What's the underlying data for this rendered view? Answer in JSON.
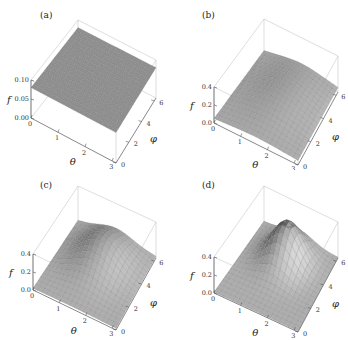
{
  "chart_data": [
    {
      "type": "surface3d",
      "panel": "(a)",
      "xlabel": "θ",
      "ylabel": "φ",
      "zlabel": "f",
      "x_ticks": [
        "0",
        "1",
        "2",
        "3"
      ],
      "y_ticks": [
        "0",
        "2",
        "4",
        "6"
      ],
      "z_ticks": [
        "0.00",
        "0.05",
        "0.10"
      ],
      "xlim": [
        0,
        3.14
      ],
      "ylim": [
        0,
        6.28
      ],
      "zlim": [
        0,
        0.1
      ],
      "surface": {
        "kind": "flat",
        "value": 0.08
      },
      "grid": true
    },
    {
      "type": "surface3d",
      "panel": "(b)",
      "xlabel": "θ",
      "ylabel": "φ",
      "zlabel": "f",
      "x_ticks": [
        "0",
        "1",
        "2",
        "3"
      ],
      "y_ticks": [
        "0",
        "2",
        "4",
        "6"
      ],
      "z_ticks": [
        "0.0",
        "0.2",
        "0.4"
      ],
      "xlim": [
        0,
        3.14
      ],
      "ylim": [
        0,
        6.28
      ],
      "zlim": [
        0,
        0.4
      ],
      "surface": {
        "kind": "peak",
        "base": 0.05,
        "amplitude": 0.12,
        "theta0": 1.6,
        "phi0": 3.8,
        "sigma_theta": 1.1,
        "sigma_phi": 2.2
      },
      "grid": true
    },
    {
      "type": "surface3d",
      "panel": "(c)",
      "xlabel": "θ",
      "ylabel": "φ",
      "zlabel": "f",
      "x_ticks": [
        "0",
        "1",
        "2",
        "3"
      ],
      "y_ticks": [
        "0",
        "2",
        "4",
        "6"
      ],
      "z_ticks": [
        "0.0",
        "0.2",
        "0.4"
      ],
      "xlim": [
        0,
        3.14
      ],
      "ylim": [
        0,
        6.28
      ],
      "zlim": [
        0,
        0.4
      ],
      "surface": {
        "kind": "peak",
        "base": 0.02,
        "amplitude": 0.28,
        "theta0": 1.5,
        "phi0": 4.2,
        "sigma_theta": 0.8,
        "sigma_phi": 1.5
      },
      "grid": true
    },
    {
      "type": "surface3d",
      "panel": "(d)",
      "xlabel": "θ",
      "ylabel": "φ",
      "zlabel": "f",
      "x_ticks": [
        "0",
        "1",
        "2",
        "3"
      ],
      "y_ticks": [
        "0",
        "2",
        "4",
        "6"
      ],
      "z_ticks": [
        "0.0",
        "0.2",
        "0.4"
      ],
      "xlim": [
        0,
        3.14
      ],
      "ylim": [
        0,
        6.28
      ],
      "zlim": [
        0,
        0.4
      ],
      "surface": {
        "kind": "peak",
        "base": 0.01,
        "amplitude": 0.42,
        "theta0": 1.5,
        "phi0": 4.4,
        "sigma_theta": 0.6,
        "sigma_phi": 1.1
      },
      "grid": true
    }
  ],
  "panels": [
    {
      "label": "(a)"
    },
    {
      "label": "(b)"
    },
    {
      "label": "(c)"
    },
    {
      "label": "(d)"
    }
  ]
}
